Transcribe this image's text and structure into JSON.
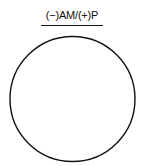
{
  "diagram": {
    "title": "(−)AM/(+)P",
    "shape": "circle",
    "colors": {
      "stroke": "#111111",
      "background": "#ffffff"
    }
  }
}
